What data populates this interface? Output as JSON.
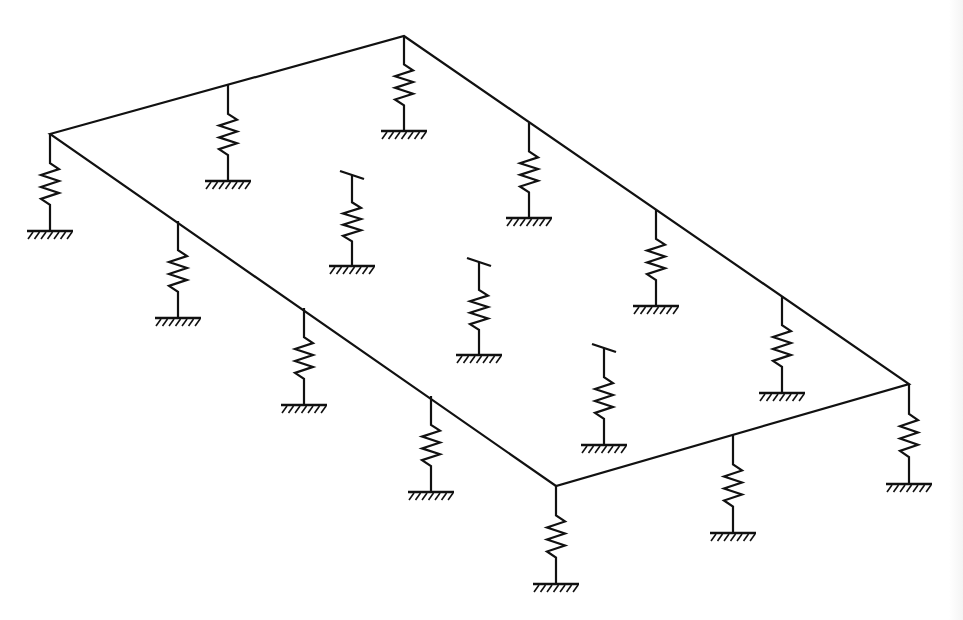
{
  "diagram": {
    "title": "",
    "colors": {
      "stroke": "#111111",
      "background": "#ffffff"
    },
    "plate": {
      "corners": [
        [
          50,
          134
        ],
        [
          404,
          36
        ],
        [
          909,
          384
        ],
        [
          556,
          486
        ]
      ]
    },
    "spring_style": {
      "coil_count": 3,
      "coil_half_width": 9,
      "ground_half_width": 23,
      "hatch_count": 7
    },
    "springs": [
      {
        "id": "corner-left",
        "x": 50,
        "top": 134,
        "ground": 231,
        "interior": false
      },
      {
        "id": "edge-top-1",
        "x": 228,
        "top": 85,
        "ground": 181,
        "interior": false
      },
      {
        "id": "corner-top",
        "x": 404,
        "top": 36,
        "ground": 131,
        "interior": false
      },
      {
        "id": "edge-topright-1",
        "x": 529,
        "top": 123,
        "ground": 218,
        "interior": false
      },
      {
        "id": "edge-topright-2",
        "x": 656,
        "top": 210,
        "ground": 306,
        "interior": false
      },
      {
        "id": "edge-topright-3",
        "x": 782,
        "top": 296,
        "ground": 393,
        "interior": false
      },
      {
        "id": "corner-right",
        "x": 909,
        "top": 384,
        "ground": 484,
        "interior": false
      },
      {
        "id": "edge-bottomright-1",
        "x": 733,
        "top": 435,
        "ground": 533,
        "interior": false
      },
      {
        "id": "corner-bottom",
        "x": 556,
        "top": 486,
        "ground": 584,
        "interior": false
      },
      {
        "id": "edge-bottomleft-1",
        "x": 178,
        "top": 221,
        "ground": 318,
        "interior": false
      },
      {
        "id": "edge-bottomleft-2",
        "x": 304,
        "top": 308,
        "ground": 405,
        "interior": false
      },
      {
        "id": "edge-bottomleft-3",
        "x": 431,
        "top": 396,
        "ground": 492,
        "interior": false
      },
      {
        "id": "interior-1",
        "x": 352,
        "top": 175,
        "ground": 266,
        "interior": true
      },
      {
        "id": "interior-2",
        "x": 479,
        "top": 262,
        "ground": 355,
        "interior": true
      },
      {
        "id": "interior-3",
        "x": 604,
        "top": 348,
        "ground": 445,
        "interior": true
      }
    ]
  }
}
